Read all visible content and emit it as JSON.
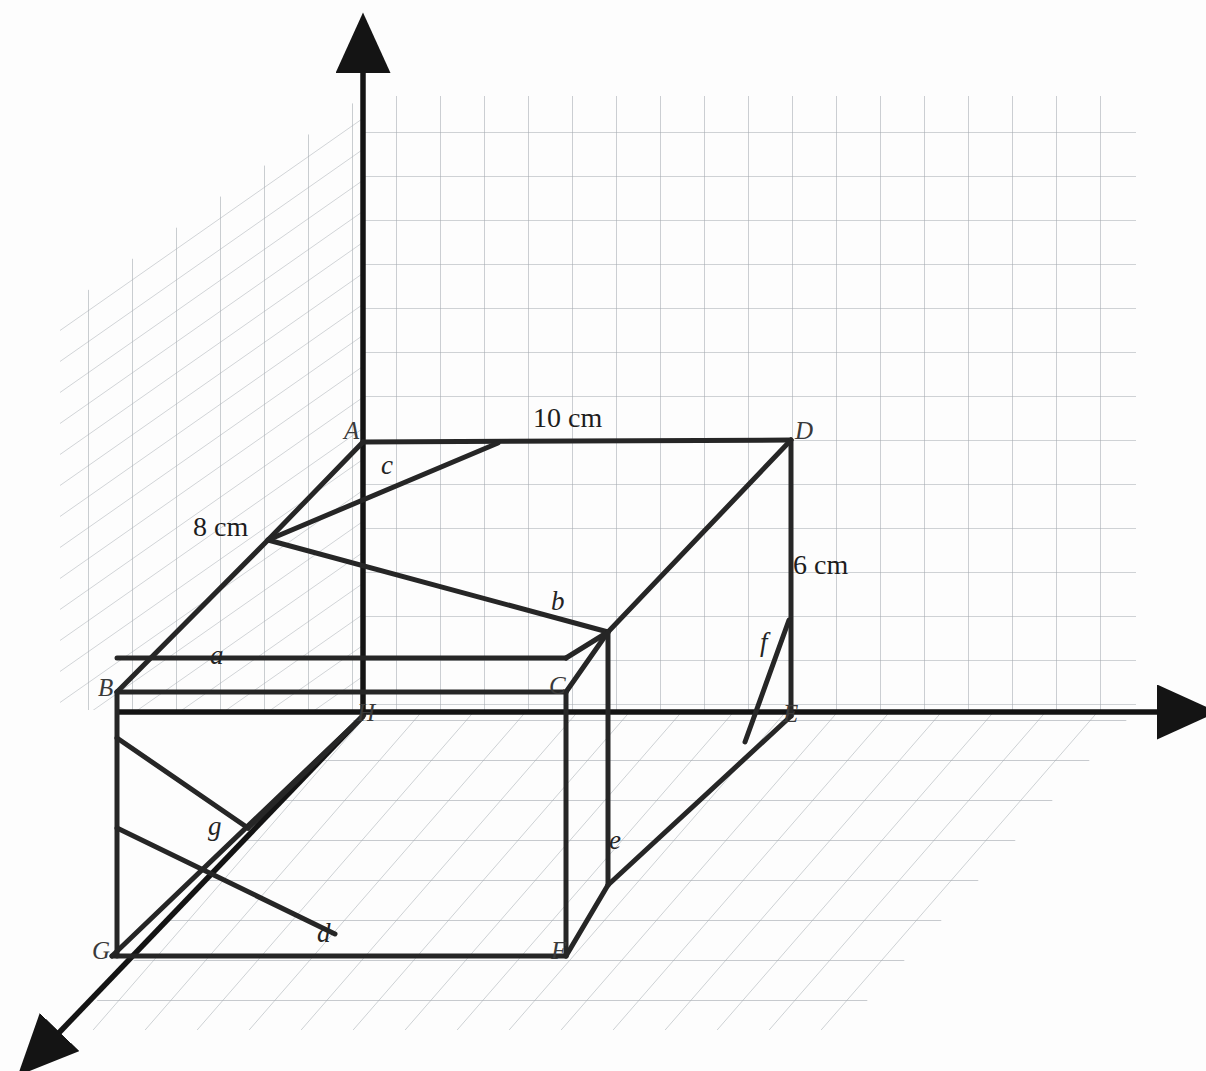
{
  "figure": {
    "kind": "3d-cuboid-diagram",
    "background_color": "#fdfdfd",
    "ink_color": "#262626",
    "grid_color": "#9aa0a6",
    "axis_color": "#1a1a1a"
  },
  "dimensions": [
    {
      "id": "length",
      "text": "10 cm",
      "x": 533,
      "y": 404,
      "edge": "A-D"
    },
    {
      "id": "width",
      "text": "8 cm",
      "x": 193,
      "y": 513,
      "edge": "B-A"
    },
    {
      "id": "height",
      "text": "6 cm",
      "x": 793,
      "y": 551,
      "edge": "D-E"
    }
  ],
  "vertices": [
    {
      "id": "A",
      "text": "A",
      "x": 344,
      "y": 418,
      "px": 363,
      "py": 442
    },
    {
      "id": "D",
      "text": "D",
      "x": 795,
      "y": 418,
      "px": 791,
      "py": 440
    },
    {
      "id": "B",
      "text": "B",
      "x": 98,
      "y": 675,
      "px": 117,
      "py": 692
    },
    {
      "id": "C",
      "text": "C",
      "x": 549,
      "y": 673,
      "px": 566,
      "py": 692
    },
    {
      "id": "H",
      "text": "H",
      "x": 357,
      "y": 700,
      "px": 363,
      "py": 716
    },
    {
      "id": "E",
      "text": "E",
      "x": 783,
      "y": 701,
      "px": 791,
      "py": 716
    },
    {
      "id": "G",
      "text": "G",
      "x": 92,
      "y": 938,
      "px": 112,
      "py": 956
    },
    {
      "id": "F",
      "text": "F",
      "x": 551,
      "y": 938,
      "px": 563,
      "py": 956
    }
  ],
  "edge_labels": [
    {
      "id": "a",
      "text": "a",
      "x": 210,
      "y": 642
    },
    {
      "id": "b",
      "text": "b",
      "x": 551,
      "y": 588
    },
    {
      "id": "c",
      "text": "c",
      "x": 381,
      "y": 452
    },
    {
      "id": "d",
      "text": "d",
      "x": 317,
      "y": 920
    },
    {
      "id": "e",
      "text": "e",
      "x": 609,
      "y": 827
    },
    {
      "id": "f",
      "text": "f",
      "x": 760,
      "y": 629
    },
    {
      "id": "g",
      "text": "g",
      "x": 208,
      "y": 813
    }
  ],
  "axes": [
    {
      "id": "z-axis",
      "direction": "up",
      "label": ""
    },
    {
      "id": "x-axis",
      "direction": "right",
      "label": ""
    },
    {
      "id": "y-axis",
      "direction": "down-left",
      "label": ""
    }
  ],
  "planes": [
    {
      "id": "back-wall",
      "type": "rectangular-grid"
    },
    {
      "id": "left-wall",
      "type": "sheared-grid"
    },
    {
      "id": "floor",
      "type": "sheared-grid"
    }
  ]
}
